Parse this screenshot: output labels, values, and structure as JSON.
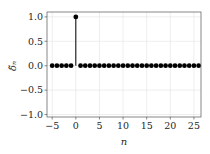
{
  "chart_data": {
    "type": "stem",
    "title": "",
    "xlabel": "n",
    "ylabel": "δ̃ₙ",
    "xlim": [
      -6.1,
      26.5
    ],
    "ylim": [
      -1.05,
      1.1
    ],
    "xticks": [
      -5,
      0,
      5,
      10,
      15,
      20,
      25
    ],
    "xtick_labels": [
      "−5",
      "0",
      "5",
      "10",
      "15",
      "20",
      "25"
    ],
    "yticks": [
      1.0,
      0.5,
      0.0,
      -0.5,
      -1.0
    ],
    "ytick_labels": [
      "1.0",
      "0.5",
      "0.0",
      "−0.5",
      "−1.0"
    ],
    "grid": true,
    "legend": null,
    "series": [
      {
        "name": "unit impulse",
        "color": "#000000",
        "x": [
          -5,
          -4,
          -3,
          -2,
          -1,
          0,
          1,
          2,
          3,
          4,
          5,
          6,
          7,
          8,
          9,
          10,
          11,
          12,
          13,
          14,
          15,
          16,
          17,
          18,
          19,
          20,
          21,
          22,
          23,
          24,
          25,
          26
        ],
        "values": [
          0,
          0,
          0,
          0,
          0,
          1,
          0,
          0,
          0,
          0,
          0,
          0,
          0,
          0,
          0,
          0,
          0,
          0,
          0,
          0,
          0,
          0,
          0,
          0,
          0,
          0,
          0,
          0,
          0,
          0,
          0,
          0
        ]
      }
    ]
  }
}
